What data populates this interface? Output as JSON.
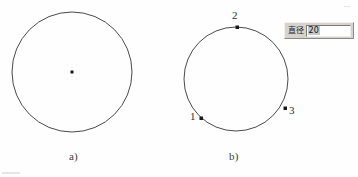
{
  "figure": {
    "caption_a": "a)",
    "caption_b": "b)",
    "circle_a": {
      "center_point_marker": "center-dot",
      "cx": 72,
      "cy": 72,
      "r": 60
    },
    "circle_b": {
      "cx": 236,
      "cy": 79,
      "r": 52,
      "points": [
        {
          "label": "1",
          "x": 201,
          "y": 118
        },
        {
          "label": "2",
          "x": 237,
          "y": 27
        },
        {
          "label": "3",
          "x": 285,
          "y": 108
        }
      ]
    }
  },
  "dialog": {
    "label": "直径",
    "value": "20"
  },
  "colors": {
    "stroke": "#4a4a4a",
    "point_fill": "#1a1a1a",
    "dialog_face": "#d6d3ce",
    "input_bg": "#ffffff",
    "text": "#2e2e2e"
  }
}
